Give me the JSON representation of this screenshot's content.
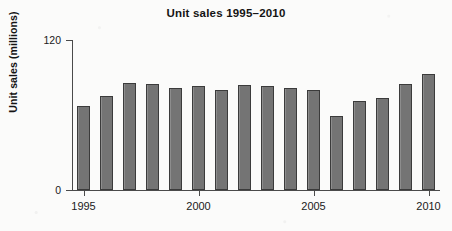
{
  "chart_data": {
    "type": "bar",
    "title": "Unit sales 1995–2010",
    "xlabel": "",
    "ylabel": "Unit sales (millions)",
    "ylim": [
      0,
      120
    ],
    "yticks": [
      0,
      120
    ],
    "ytick_labels": [
      "0",
      "120"
    ],
    "grid": false,
    "legend": false,
    "bar_color": "#747474",
    "bar_edge_color": "#3b3b3b",
    "categories": [
      "1995",
      "1996",
      "1997",
      "1998",
      "1999",
      "2000",
      "2001",
      "2002",
      "2003",
      "2004",
      "2005",
      "2006",
      "2007",
      "2008",
      "2009",
      "2010"
    ],
    "xtick_labels": [
      "1995",
      "2000",
      "2005",
      "2010"
    ],
    "xtick_categories": [
      "1995",
      "2000",
      "2005",
      "2010"
    ],
    "values": [
      67,
      75,
      86,
      85,
      82,
      83,
      80,
      84,
      83,
      82,
      80,
      59,
      71,
      74,
      85,
      93
    ],
    "series": [
      {
        "name": "Unit sales",
        "values": [
          67,
          75,
          86,
          85,
          82,
          83,
          80,
          84,
          83,
          82,
          80,
          59,
          71,
          74,
          85,
          93
        ]
      }
    ]
  }
}
